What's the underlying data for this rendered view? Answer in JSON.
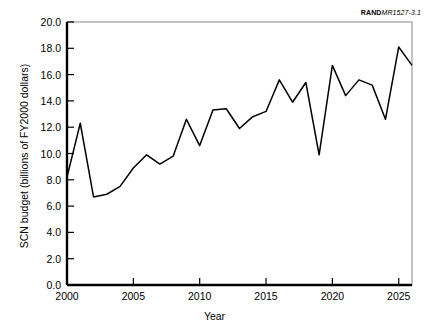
{
  "figure": {
    "id_prefix": "RAND",
    "id_suffix": "MR1527-3.1",
    "xlabel": "Year",
    "ylabel": "SCN budget (billions of FY2000 dollars)"
  },
  "chart_data": {
    "type": "line",
    "title": "",
    "xlabel": "Year",
    "ylabel": "SCN budget (billions of FY2000 dollars)",
    "xlim": [
      2000,
      2026
    ],
    "ylim": [
      0.0,
      20.0
    ],
    "xticks": [
      2000,
      2005,
      2010,
      2015,
      2020,
      2025
    ],
    "xtick_labels": [
      "2000",
      "2005",
      "2010",
      "2015",
      "2020",
      "2025"
    ],
    "yticks": [
      0.0,
      2.0,
      4.0,
      6.0,
      8.0,
      10.0,
      12.0,
      14.0,
      16.0,
      18.0,
      20.0
    ],
    "ytick_labels": [
      "0.0",
      "2.0",
      "4.0",
      "6.0",
      "8.0",
      "10.0",
      "12.0",
      "14.0",
      "16.0",
      "18.0",
      "20.0"
    ],
    "grid": false,
    "legend": null,
    "line_color": "#000000",
    "x": [
      2000,
      2001,
      2002,
      2003,
      2004,
      2005,
      2006,
      2007,
      2008,
      2009,
      2010,
      2011,
      2012,
      2013,
      2014,
      2015,
      2016,
      2017,
      2018,
      2019,
      2020,
      2021,
      2022,
      2023,
      2024,
      2025,
      2026
    ],
    "values": [
      8.2,
      12.3,
      6.7,
      6.9,
      7.5,
      8.9,
      9.9,
      9.2,
      9.8,
      12.6,
      10.6,
      13.3,
      13.4,
      11.9,
      12.8,
      13.2,
      15.6,
      13.9,
      15.4,
      9.9,
      16.7,
      14.4,
      15.6,
      15.2,
      12.6,
      18.1,
      16.7
    ]
  }
}
